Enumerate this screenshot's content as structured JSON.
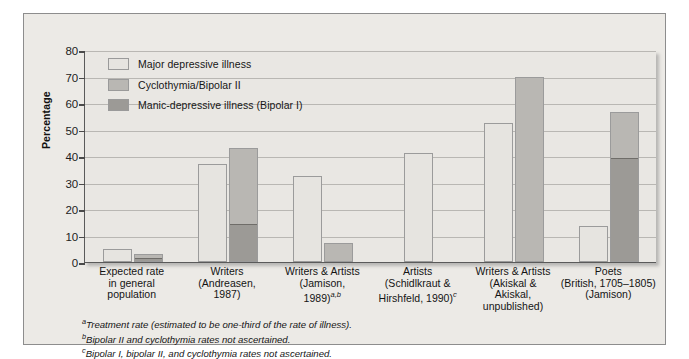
{
  "chart_data": {
    "type": "bar",
    "title": "",
    "xlabel": "",
    "ylabel": "Percentage",
    "ylim": [
      0,
      80
    ],
    "yticks": [
      0,
      10,
      20,
      30,
      40,
      50,
      60,
      70,
      80
    ],
    "grid": true,
    "legend_position": "top-left",
    "stacked": "partial",
    "categories": [
      "Expected rate\nin general\npopulation",
      "Writers\n(Andreasen,\n1987)",
      "Writers & Artists\n(Jamison,\n1989)a,b",
      "Artists\n(Schidlkraut &\nHirshfeld, 1990)c",
      "Writers & Artists\n(Akiskal &\nAkiskal,\nunpublished)",
      "Poets\n(British, 1705–1805)\n(Jamison)"
    ],
    "series": [
      {
        "name": "Major depressive illness",
        "color": "#e6e4e0",
        "values": [
          5.0,
          37.0,
          32.5,
          41.0,
          52.5,
          13.5
        ]
      },
      {
        "name": "Cyclothymia/Bipolar II",
        "color": "#b9b7b3",
        "values": [
          2.0,
          29.0,
          7.0,
          null,
          70.0,
          17.5
        ]
      },
      {
        "name": "Manic-depressive illness (Bipolar I)",
        "color": "#9c9a96",
        "values": [
          1.0,
          14.0,
          null,
          null,
          null,
          39.0
        ]
      }
    ],
    "bar_totals_second_column": [
      3.0,
      43.0,
      7.0,
      null,
      70.0,
      56.5
    ]
  },
  "legend": {
    "items": [
      {
        "label": "Major depressive illness",
        "color": "#e6e4e0"
      },
      {
        "label": "Cyclothymia/Bipolar II",
        "color": "#b9b7b3"
      },
      {
        "label": "Manic-depressive illness (Bipolar I)",
        "color": "#9c9a96"
      }
    ]
  },
  "axis": {
    "y_title": "Percentage",
    "y_labels": [
      "80",
      "70",
      "60",
      "50",
      "40",
      "30",
      "20",
      "10",
      "0"
    ]
  },
  "x_categories": [
    {
      "line1": "Expected rate",
      "line2": "in general",
      "line3": "population",
      "line4": ""
    },
    {
      "line1": "Writers",
      "line2": "(Andreasen,",
      "line3": "1987)",
      "line4": ""
    },
    {
      "line1": "Writers & Artists",
      "line2": "(Jamison,",
      "line3": "1989)",
      "sup": "a,b",
      "line4": ""
    },
    {
      "line1": "Artists",
      "line2": "(Schidlkraut &",
      "line3": "Hirshfeld, 1990)",
      "sup": "c",
      "line4": ""
    },
    {
      "line1": "Writers & Artists",
      "line2": "(Akiskal &",
      "line3": "Akiskal,",
      "line4": "unpublished)"
    },
    {
      "line1": "Poets",
      "line2": "(British, 1705–1805)",
      "line3": "(Jamison)",
      "line4": ""
    }
  ],
  "footnotes": [
    {
      "marker": "a",
      "text": "Treatment rate (estimated to be one-third of the rate of illness)."
    },
    {
      "marker": "b",
      "text": "Bipolar II and cyclothymia rates not ascertained."
    },
    {
      "marker": "c",
      "text": "Bipolar I, bipolar II, and cyclothymia rates not ascertained."
    }
  ]
}
